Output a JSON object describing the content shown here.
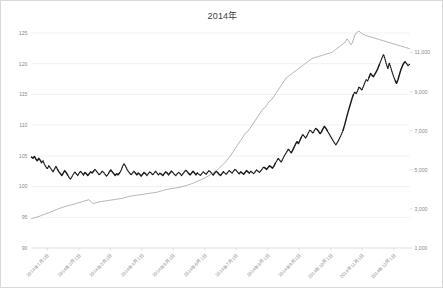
{
  "chart_data": {
    "type": "line",
    "title": "2014年",
    "xlabel": "",
    "ylabel": "",
    "grid": true,
    "legend": "none",
    "axes": {
      "left": {
        "label": "",
        "ylim": [
          90,
          125
        ],
        "ticks": [
          90,
          95,
          100,
          105,
          110,
          115,
          120,
          125
        ],
        "tick_labels": [
          "90",
          "95",
          "100",
          "105",
          "110",
          "115",
          "120",
          "125"
        ]
      },
      "right": {
        "label": "",
        "ylim": [
          1000,
          12000
        ],
        "ticks": [
          1000,
          3000,
          5000,
          7000,
          9000,
          11000
        ],
        "tick_labels": [
          "1,000",
          "3,000",
          "5,000",
          "7,000",
          "9,000",
          "11,000"
        ]
      },
      "x": {
        "tick_labels": [
          "2014年1月1日",
          "2014年2月1日",
          "2014年3月1日",
          "2014年4月1日",
          "2014年5月1日",
          "2014年6月1日",
          "2014年7月1日",
          "2014年8月1日",
          "2014年9月1日",
          "2014年10月1日",
          "2014年11月1日",
          "2014年12月1日"
        ],
        "rotation": -45
      }
    },
    "series": [
      {
        "name": "為替レート",
        "axis": "left",
        "color": "#1a1a1a",
        "style": "alternating-solid-dotted",
        "values": [
          104.8,
          104.6,
          104.9,
          104.5,
          104.2,
          104.6,
          104.3,
          103.9,
          104.2,
          103.6,
          103.2,
          102.9,
          103.4,
          103.1,
          102.7,
          102.4,
          102.9,
          103.3,
          102.8,
          102.4,
          102.1,
          101.8,
          102.2,
          102.6,
          102.3,
          101.9,
          101.5,
          101.2,
          101.6,
          102.0,
          102.4,
          102.1,
          101.8,
          102.2,
          102.5,
          102.2,
          101.9,
          102.3,
          102.1,
          101.8,
          102.1,
          102.4,
          102.2,
          102.5,
          102.8,
          102.5,
          102.2,
          101.9,
          102.2,
          102.5,
          102.3,
          102.0,
          101.7,
          102.0,
          102.4,
          102.7,
          102.4,
          102.1,
          101.8,
          102.1,
          101.9,
          102.2,
          102.6,
          103.2,
          103.7,
          103.4,
          102.9,
          102.5,
          102.2,
          101.9,
          102.2,
          102.5,
          102.2,
          101.9,
          102.2,
          102.0,
          101.7,
          102.0,
          102.3,
          102.1,
          101.8,
          102.1,
          102.4,
          102.2,
          101.9,
          102.2,
          102.5,
          102.2,
          101.9,
          102.2,
          102.0,
          101.8,
          102.1,
          102.4,
          102.2,
          101.9,
          102.2,
          102.5,
          102.3,
          102.0,
          101.8,
          102.1,
          102.3,
          102.1,
          101.8,
          102.1,
          102.4,
          102.7,
          102.4,
          102.1,
          101.9,
          102.2,
          102.5,
          102.2,
          101.9,
          102.2,
          102.0,
          101.8,
          102.1,
          102.4,
          102.2,
          102.0,
          102.3,
          102.6,
          102.4,
          102.1,
          101.9,
          102.2,
          102.5,
          102.3,
          102.0,
          101.8,
          102.1,
          102.4,
          102.2,
          102.0,
          102.3,
          102.6,
          102.4,
          102.2,
          102.5,
          102.8,
          102.6,
          102.3,
          102.1,
          102.4,
          102.2,
          102.0,
          102.3,
          102.6,
          102.4,
          102.2,
          102.5,
          102.3,
          102.1,
          102.4,
          102.7,
          102.5,
          102.3,
          102.6,
          102.9,
          103.2,
          103.0,
          102.8,
          103.1,
          103.4,
          103.2,
          103.0,
          103.3,
          103.8,
          104.2,
          104.6,
          104.3,
          104.0,
          104.4,
          104.9,
          105.3,
          105.7,
          106.1,
          105.8,
          105.5,
          105.9,
          106.4,
          106.9,
          107.3,
          107.0,
          107.5,
          108.0,
          108.5,
          108.2,
          107.9,
          108.3,
          108.8,
          109.2,
          109.0,
          108.7,
          109.1,
          109.5,
          109.3,
          109.0,
          108.6,
          108.9,
          109.4,
          109.8,
          109.5,
          109.1,
          108.7,
          108.3,
          107.9,
          107.5,
          107.1,
          106.8,
          107.2,
          107.6,
          108.1,
          108.6,
          109.2,
          110.0,
          110.9,
          111.8,
          112.6,
          113.4,
          114.2,
          114.9,
          115.4,
          115.1,
          115.6,
          116.2,
          116.0,
          115.7,
          116.3,
          116.9,
          117.4,
          117.2,
          117.8,
          118.4,
          118.1,
          117.9,
          118.3,
          118.7,
          119.2,
          119.8,
          120.4,
          121.0,
          121.5,
          120.8,
          119.9,
          119.2,
          120.1,
          119.4,
          118.6,
          117.9,
          117.3,
          116.8,
          117.4,
          118.2,
          119.0,
          119.6,
          120.1,
          120.3,
          120.0,
          119.7,
          119.9
        ]
      },
      {
        "name": "出来高",
        "axis": "right",
        "color": "#9a9a9a",
        "style": "solid",
        "values": [
          2500,
          2520,
          2540,
          2560,
          2580,
          2600,
          2620,
          2650,
          2680,
          2700,
          2720,
          2750,
          2780,
          2800,
          2820,
          2850,
          2880,
          2900,
          2930,
          2960,
          2990,
          3010,
          3040,
          3060,
          3080,
          3100,
          3120,
          3140,
          3160,
          3180,
          3200,
          3210,
          3230,
          3250,
          3270,
          3290,
          3310,
          3330,
          3350,
          3370,
          3390,
          3410,
          3430,
          3450,
          3470,
          3420,
          3360,
          3300,
          3280,
          3300,
          3320,
          3340,
          3360,
          3370,
          3380,
          3390,
          3400,
          3410,
          3420,
          3430,
          3440,
          3450,
          3460,
          3470,
          3480,
          3490,
          3500,
          3510,
          3520,
          3530,
          3540,
          3560,
          3580,
          3600,
          3620,
          3640,
          3650,
          3660,
          3670,
          3680,
          3690,
          3700,
          3710,
          3720,
          3730,
          3740,
          3750,
          3760,
          3770,
          3780,
          3790,
          3800,
          3810,
          3820,
          3830,
          3840,
          3850,
          3860,
          3880,
          3900,
          3920,
          3940,
          3960,
          3980,
          4000,
          4010,
          4020,
          4030,
          4040,
          4050,
          4060,
          4070,
          4080,
          4090,
          4100,
          4120,
          4140,
          4160,
          4180,
          4200,
          4220,
          4240,
          4260,
          4280,
          4300,
          4330,
          4360,
          4390,
          4420,
          4450,
          4480,
          4510,
          4540,
          4570,
          4600,
          4640,
          4680,
          4720,
          4760,
          4800,
          4850,
          4900,
          4950,
          5000,
          5060,
          5120,
          5180,
          5240,
          5300,
          5380,
          5460,
          5540,
          5620,
          5700,
          5800,
          5900,
          6000,
          6100,
          6200,
          6300,
          6400,
          6500,
          6600,
          6700,
          6800,
          6900,
          6950,
          7000,
          7100,
          7200,
          7300,
          7400,
          7500,
          7600,
          7700,
          7800,
          7900,
          8000,
          8100,
          8150,
          8200,
          8300,
          8400,
          8500,
          8550,
          8600,
          8700,
          8800,
          8900,
          9000,
          9100,
          9200,
          9300,
          9400,
          9500,
          9600,
          9700,
          9750,
          9800,
          9850,
          9900,
          9950,
          10000,
          10050,
          10100,
          10150,
          10200,
          10250,
          10300,
          10350,
          10400,
          10450,
          10500,
          10550,
          10600,
          10650,
          10700,
          10720,
          10740,
          10760,
          10780,
          10800,
          10820,
          10840,
          10860,
          10880,
          10900,
          10920,
          10940,
          10960,
          10980,
          11000,
          11050,
          11100,
          11150,
          11200,
          11250,
          11300,
          11350,
          11400,
          11450,
          11500,
          11600,
          11700,
          11600,
          11500,
          11400,
          11500,
          11700,
          11900,
          12000,
          12050,
          12100,
          12050,
          12000,
          11950,
          11900,
          11880,
          11860,
          11840,
          11820,
          11800,
          11780,
          11760,
          11740,
          11720,
          11700,
          11680,
          11660,
          11640,
          11620,
          11600,
          11580,
          11560,
          11540,
          11520,
          11500,
          11480,
          11460,
          11440,
          11420,
          11400,
          11380,
          11360,
          11340,
          11320,
          11300,
          11280,
          11260,
          11240,
          11220,
          11200
        ]
      }
    ]
  }
}
